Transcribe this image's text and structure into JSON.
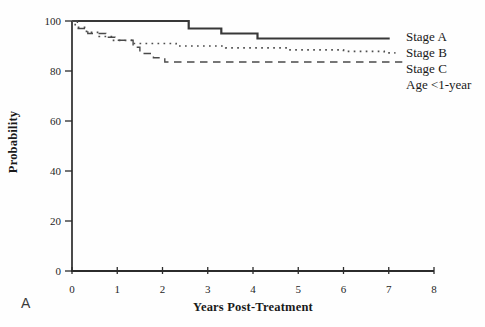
{
  "panel_label": "A",
  "colors": {
    "axis": "#2b2b2b",
    "solid_line": "#383838",
    "dotted_line": "#4e4e4e",
    "dashed_line": "#4a4a4a",
    "text": "#1a1a1a",
    "background": "#fefefe"
  },
  "chart_data": {
    "type": "line",
    "subtype": "kaplan-meier-step",
    "title": "",
    "xlabel": "Years Post-Treatment",
    "ylabel": "Probability",
    "xlim": [
      0,
      8
    ],
    "ylim": [
      0,
      100
    ],
    "x_ticks": [
      0,
      1,
      2,
      3,
      4,
      5,
      6,
      7,
      8
    ],
    "y_ticks": [
      0,
      20,
      40,
      60,
      80,
      100
    ],
    "grid": false,
    "legend_position": "right-outside",
    "legend_note": "Age <1-year",
    "series": [
      {
        "name": "Stage A",
        "style": "solid",
        "points": [
          [
            0,
            100
          ],
          [
            2.58,
            97
          ],
          [
            3.3,
            95
          ],
          [
            4.1,
            93
          ],
          [
            7.02,
            93
          ]
        ]
      },
      {
        "name": "Stage B",
        "style": "dotted",
        "points": [
          [
            0,
            100
          ],
          [
            0.07,
            97.5
          ],
          [
            0.32,
            95.5
          ],
          [
            0.6,
            93.8
          ],
          [
            0.9,
            92.3
          ],
          [
            1.35,
            91
          ],
          [
            2.3,
            90
          ],
          [
            3.4,
            89.3
          ],
          [
            4.8,
            88.5
          ],
          [
            6.0,
            87.9
          ],
          [
            6.9,
            87.3
          ],
          [
            7.15,
            87.3
          ]
        ]
      },
      {
        "name": "Stage C",
        "style": "dashed",
        "points": [
          [
            0,
            100
          ],
          [
            0.12,
            97
          ],
          [
            0.35,
            95
          ],
          [
            0.75,
            93.5
          ],
          [
            0.95,
            92.3
          ],
          [
            1.35,
            89.5
          ],
          [
            1.5,
            87
          ],
          [
            1.8,
            85.3
          ],
          [
            2.05,
            83.6
          ],
          [
            7.3,
            83.6
          ]
        ]
      }
    ]
  }
}
